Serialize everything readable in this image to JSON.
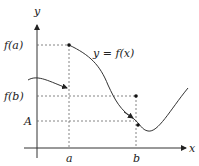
{
  "diagram": {
    "axes": {
      "x_label": "x",
      "y_label": "y"
    },
    "curve_label": "y = f(x)",
    "y_ticks": {
      "fa": "f(a)",
      "fb": "f(b)",
      "A": "A"
    },
    "x_ticks": {
      "a": "a",
      "b": "b"
    },
    "colors": {
      "stroke": "#333333",
      "dashed": "#555555",
      "background": "#ffffff"
    }
  }
}
